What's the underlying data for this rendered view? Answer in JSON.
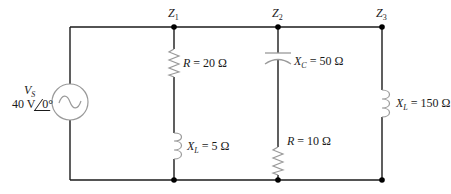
{
  "diagram": {
    "type": "ac-parallel-circuit",
    "colors": {
      "wire": "#1a1a1a",
      "component": "#9a9a9a",
      "node": "#000000",
      "background": "#ffffff"
    },
    "source": {
      "name_main": "V",
      "name_sub": "S",
      "magnitude": "40 V",
      "angle": "0°",
      "icon": "ac-source-icon"
    },
    "branches": [
      {
        "node_main": "Z",
        "node_sub": "1",
        "components": [
          {
            "type": "resistor",
            "sym": "R",
            "sub": "",
            "value": " = 20 Ω"
          },
          {
            "type": "inductor",
            "sym": "X",
            "sub": "L",
            "value": " = 5 Ω"
          }
        ]
      },
      {
        "node_main": "Z",
        "node_sub": "2",
        "components": [
          {
            "type": "capacitor",
            "sym": "X",
            "sub": "C",
            "value": " = 50 Ω"
          },
          {
            "type": "resistor",
            "sym": "R",
            "sub": "",
            "value": " = 10 Ω"
          }
        ]
      },
      {
        "node_main": "Z",
        "node_sub": "3",
        "components": [
          {
            "type": "inductor",
            "sym": "X",
            "sub": "L",
            "value": " = 150 Ω"
          }
        ]
      }
    ]
  }
}
